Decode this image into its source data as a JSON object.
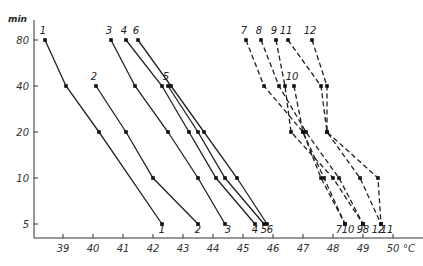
{
  "chart_data": {
    "type": "line",
    "title": "",
    "xlabel": "°C",
    "ylabel": "min",
    "x_scale": "linear",
    "y_scale": "log",
    "xlim": [
      38,
      50.5
    ],
    "ylim": [
      5,
      80
    ],
    "x_ticks": [
      39,
      40,
      41,
      42,
      43,
      44,
      45,
      46,
      47,
      48,
      49,
      50
    ],
    "x_tick_labels": [
      "39",
      "40",
      "41",
      "42",
      "43",
      "44",
      "45",
      "46",
      "47",
      "48",
      "49",
      "50"
    ],
    "x_unit_label": "°C",
    "y_ticks": [
      5,
      10,
      20,
      40,
      80
    ],
    "y_tick_labels": [
      "5",
      "10",
      "20",
      "40",
      "80"
    ],
    "grid": false,
    "legend": "inline curve numbers at top and bottom of each curve",
    "series": [
      {
        "name": "1",
        "style": "solid",
        "points": [
          [
            38.4,
            80
          ],
          [
            39.1,
            40
          ],
          [
            40.2,
            20
          ],
          [
            42.3,
            5
          ]
        ]
      },
      {
        "name": "2",
        "style": "solid",
        "points": [
          [
            40.1,
            40
          ],
          [
            41.1,
            20
          ],
          [
            42.0,
            10
          ],
          [
            43.5,
            5
          ]
        ]
      },
      {
        "name": "3",
        "style": "solid",
        "points": [
          [
            40.6,
            80
          ],
          [
            41.4,
            40
          ],
          [
            42.5,
            20
          ],
          [
            43.5,
            10
          ],
          [
            44.4,
            5
          ]
        ]
      },
      {
        "name": "4",
        "style": "solid",
        "points": [
          [
            41.1,
            80
          ],
          [
            42.3,
            40
          ],
          [
            43.2,
            20
          ],
          [
            44.1,
            10
          ],
          [
            45.4,
            5
          ]
        ]
      },
      {
        "name": "5",
        "style": "solid",
        "points": [
          [
            42.5,
            40
          ],
          [
            43.5,
            20
          ],
          [
            44.4,
            10
          ],
          [
            45.7,
            5
          ]
        ]
      },
      {
        "name": "6",
        "style": "solid",
        "points": [
          [
            41.5,
            80
          ],
          [
            42.6,
            40
          ],
          [
            43.7,
            20
          ],
          [
            44.8,
            10
          ],
          [
            45.8,
            5
          ]
        ]
      },
      {
        "name": "7",
        "style": "dashed",
        "points": [
          [
            45.1,
            80
          ],
          [
            45.7,
            40
          ],
          [
            47.0,
            20
          ],
          [
            47.6,
            10
          ],
          [
            48.4,
            5
          ]
        ]
      },
      {
        "name": "8",
        "style": "dashed",
        "points": [
          [
            45.6,
            80
          ],
          [
            46.2,
            40
          ],
          [
            47.1,
            20
          ],
          [
            48.2,
            10
          ],
          [
            49.0,
            5
          ]
        ]
      },
      {
        "name": "9",
        "style": "dashed",
        "points": [
          [
            46.1,
            80
          ],
          [
            46.4,
            40
          ],
          [
            46.6,
            20
          ],
          [
            48.0,
            10
          ],
          [
            49.0,
            5
          ]
        ]
      },
      {
        "name": "10",
        "style": "dashed",
        "points": [
          [
            46.7,
            40
          ],
          [
            47.0,
            20
          ],
          [
            47.7,
            10
          ],
          [
            48.4,
            5
          ]
        ]
      },
      {
        "name": "11",
        "style": "dashed",
        "points": [
          [
            46.5,
            80
          ],
          [
            47.6,
            40
          ],
          [
            47.8,
            20
          ],
          [
            49.5,
            10
          ],
          [
            49.6,
            5
          ]
        ]
      },
      {
        "name": "12",
        "style": "dashed",
        "points": [
          [
            47.3,
            80
          ],
          [
            47.8,
            40
          ],
          [
            47.8,
            20
          ],
          [
            48.9,
            10
          ],
          [
            49.6,
            5
          ]
        ]
      }
    ],
    "bottom_labels": [
      {
        "text": "1",
        "x": 42.3
      },
      {
        "text": "2",
        "x": 43.5
      },
      {
        "text": "3",
        "x": 44.5
      },
      {
        "text": "4",
        "x": 45.4
      },
      {
        "text": "5",
        "x": 45.7
      },
      {
        "text": "6",
        "x": 45.9
      },
      {
        "text": "7",
        "x": 48.2
      },
      {
        "text": "10",
        "x": 48.5
      },
      {
        "text": "9",
        "x": 48.9
      },
      {
        "text": "8",
        "x": 49.1
      },
      {
        "text": "12",
        "x": 49.5
      },
      {
        "text": "11",
        "x": 49.8
      }
    ]
  }
}
